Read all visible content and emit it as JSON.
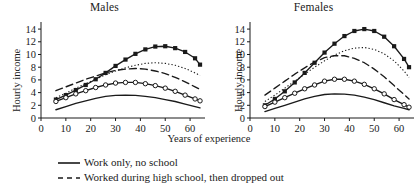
{
  "figure": {
    "xlabel": "Years of experience",
    "ylabel": "Hourly income"
  },
  "panels": [
    {
      "title": "Males"
    },
    {
      "title": "Females"
    }
  ],
  "legend": [
    {
      "label": "Work only, no school",
      "style": "solid",
      "swatch": "line-solid-swatch"
    },
    {
      "label": "Worked during high school, then dropped out",
      "style": "dashed",
      "swatch": "line-dashed-swatch"
    }
  ],
  "chart_data": [
    {
      "type": "line",
      "title": "Males",
      "xlabel": "Years of experience",
      "ylabel": "Hourly income",
      "xlim": [
        0,
        66
      ],
      "ylim": [
        0,
        14.8
      ],
      "xticks": [
        0,
        10,
        20,
        30,
        40,
        50,
        60
      ],
      "yticks": [
        0,
        2,
        4,
        6,
        8,
        10,
        12,
        14
      ],
      "grid": false,
      "legend_position": "below-figure",
      "x": [
        6,
        10,
        14,
        18,
        22,
        26,
        30,
        34,
        38,
        42,
        46,
        50,
        54,
        58,
        62,
        64
      ],
      "series": [
        {
          "name": "college-squares",
          "marker": "filled-square",
          "style": "solid",
          "values": [
            2.9,
            3.6,
            4.4,
            5.2,
            6.1,
            7.1,
            8.2,
            9.2,
            10.1,
            10.8,
            11.25,
            11.3,
            11.0,
            10.4,
            9.4,
            8.4
          ]
        },
        {
          "name": "dotted-series",
          "marker": "none",
          "style": "dotted",
          "values": [
            3.2,
            3.9,
            4.7,
            5.4,
            6.1,
            6.8,
            7.4,
            7.9,
            8.3,
            8.6,
            8.7,
            8.6,
            8.3,
            7.8,
            7.1,
            6.7
          ]
        },
        {
          "name": "long-dashed-series",
          "marker": "none",
          "style": "long-dashed",
          "values": [
            4.3,
            4.9,
            5.5,
            6.1,
            6.6,
            7.1,
            7.5,
            7.7,
            7.8,
            7.7,
            7.4,
            7.0,
            6.4,
            5.7,
            4.9,
            4.5
          ]
        },
        {
          "name": "open-circles",
          "marker": "open-circle",
          "style": "solid",
          "values": [
            2.6,
            3.2,
            3.8,
            4.3,
            4.8,
            5.2,
            5.5,
            5.6,
            5.6,
            5.4,
            5.1,
            4.7,
            4.2,
            3.6,
            3.0,
            2.7
          ]
        },
        {
          "name": "solid-no-school",
          "marker": "none",
          "style": "solid",
          "values": [
            1.3,
            1.8,
            2.3,
            2.7,
            3.1,
            3.4,
            3.55,
            3.6,
            3.55,
            3.4,
            3.2,
            2.9,
            2.6,
            2.2,
            1.8,
            1.6
          ]
        }
      ]
    },
    {
      "type": "line",
      "title": "Females",
      "xlabel": "Years of experience",
      "ylabel": "Hourly income",
      "xlim": [
        0,
        66
      ],
      "ylim": [
        0,
        14.8
      ],
      "xticks": [
        0,
        10,
        20,
        30,
        40,
        50,
        60
      ],
      "yticks": [
        0,
        2,
        4,
        6,
        8,
        10,
        12,
        14
      ],
      "grid": false,
      "legend_position": "below-figure",
      "x": [
        6,
        10,
        14,
        18,
        22,
        26,
        30,
        34,
        38,
        42,
        46,
        50,
        54,
        58,
        62,
        64
      ],
      "series": [
        {
          "name": "college-squares",
          "marker": "filled-square",
          "style": "solid",
          "values": [
            2.0,
            3.0,
            4.2,
            5.6,
            7.1,
            8.7,
            10.3,
            11.7,
            12.9,
            13.7,
            14.0,
            13.7,
            12.8,
            11.3,
            9.3,
            8.0
          ]
        },
        {
          "name": "dotted-series",
          "marker": "none",
          "style": "dotted",
          "values": [
            2.6,
            3.6,
            4.7,
            5.8,
            6.9,
            8.0,
            9.0,
            9.9,
            10.6,
            11.0,
            11.1,
            10.8,
            10.1,
            9.0,
            7.4,
            6.4
          ]
        },
        {
          "name": "long-dashed-series",
          "marker": "none",
          "style": "long-dashed",
          "values": [
            3.6,
            4.7,
            5.8,
            6.9,
            7.9,
            8.8,
            9.5,
            9.8,
            9.8,
            9.4,
            8.7,
            7.7,
            6.5,
            5.1,
            3.7,
            3.0
          ]
        },
        {
          "name": "open-circles",
          "marker": "open-circle",
          "style": "solid",
          "values": [
            1.8,
            2.5,
            3.2,
            3.9,
            4.6,
            5.2,
            5.8,
            6.1,
            6.1,
            5.8,
            5.3,
            4.6,
            3.8,
            2.9,
            2.1,
            1.7
          ]
        },
        {
          "name": "solid-no-school",
          "marker": "none",
          "style": "solid",
          "values": [
            1.0,
            1.5,
            2.0,
            2.5,
            3.0,
            3.4,
            3.7,
            3.8,
            3.75,
            3.6,
            3.3,
            2.9,
            2.4,
            1.9,
            1.5,
            1.3
          ]
        }
      ]
    }
  ]
}
